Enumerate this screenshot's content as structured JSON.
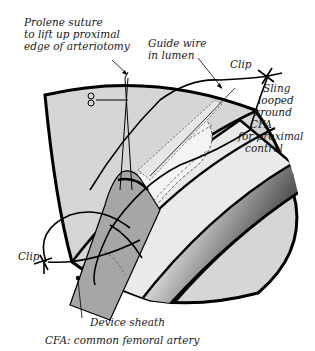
{
  "diagram": {
    "labels": {
      "prolene_line1": "Prolene suture",
      "prolene_line2": "to lift up proximal",
      "prolene_line3": "edge of arteriotomy",
      "guide_line1": "Guide wire",
      "guide_line2": "in lumen",
      "clip_top": "Clip",
      "sling_line1": "Sling",
      "sling_line2": "looped",
      "sling_line3": "around",
      "sling_line4": "CFA",
      "sling_line5": "for proximal",
      "sling_line6": "control",
      "clip_bottom": "Clip",
      "device_sheath": "Device sheath",
      "footnote": "CFA: common femoral artery"
    },
    "colors": {
      "tissue": "#d6d6d6",
      "outline": "#000000",
      "sheath": "#a8a8a8",
      "artery_light": "#ebebeb",
      "artery_dark": "#3c3c3c"
    }
  }
}
